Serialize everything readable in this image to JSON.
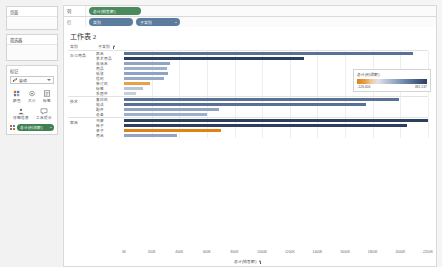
{
  "sidebar": {
    "pages": {
      "title": "页面"
    },
    "filters": {
      "title": "筛选器"
    },
    "marks": {
      "title": "标记",
      "mark_type": "自动",
      "buttons": [
        {
          "label": "颜色",
          "icon": "color-icon"
        },
        {
          "label": "大小",
          "icon": "size-icon"
        },
        {
          "label": "标签",
          "icon": "label-icon"
        },
        {
          "label": "详细信息",
          "icon": "detail-icon"
        },
        {
          "label": "工具提示",
          "icon": "tooltip-icon"
        }
      ],
      "color_pill": "总计(利润额)"
    }
  },
  "shelves": {
    "columns": {
      "name": "列",
      "pills": [
        {
          "label": "总计(销售额)",
          "type": "green",
          "caret": false
        }
      ]
    },
    "rows": {
      "name": "行",
      "pills": [
        {
          "label": "类别",
          "type": "blue",
          "caret": false
        },
        {
          "label": "子类别",
          "type": "blue",
          "caret": true
        }
      ]
    }
  },
  "view": {
    "sheet_title": "工作表 2",
    "headers": {
      "category": "类别",
      "subcategory": "子类别"
    },
    "axis_title": "总计(销售额)"
  },
  "legend": {
    "title": "总计(利润额)",
    "min": "-128,406",
    "max": "381,137"
  },
  "chart_data": {
    "type": "bar",
    "orientation": "horizontal",
    "title": "工作表 2",
    "xlabel": "总计(销售额)",
    "ylabel": "类别 / 子类别",
    "xlim": [
      0,
      2200000
    ],
    "xticks": [
      "0K",
      "200K",
      "400K",
      "600K",
      "800K",
      "1000K",
      "1200K",
      "1400K",
      "1600K",
      "1800K",
      "2000K",
      "2200K"
    ],
    "grid": true,
    "color_field": "总计(利润额)",
    "color_scale": {
      "min": -128406,
      "max": 381137,
      "low_color": "#e08214",
      "mid_color": "#c8cedb",
      "high_color": "#2d3f5e"
    },
    "groups": [
      {
        "name": "办公用品",
        "rows": [
          {
            "label": "器具",
            "value": 2090000,
            "color": "#5a7196"
          },
          {
            "label": "美术用品",
            "value": 1300000,
            "color": "#2d3f5e"
          },
          {
            "label": "收纳具",
            "value": 330000,
            "color": "#93a4c2"
          },
          {
            "label": "用品",
            "value": 310000,
            "color": "#9db0cb"
          },
          {
            "label": "纸张",
            "value": 320000,
            "color": "#8ea3c3"
          },
          {
            "label": "信封",
            "value": 290000,
            "color": "#97a9c6"
          },
          {
            "label": "装订机",
            "value": 190000,
            "color": "#e8a04a"
          },
          {
            "label": "标签",
            "value": 140000,
            "color": "#b9c4d6"
          },
          {
            "label": "系固件",
            "value": 90000,
            "color": "#c5cedd"
          }
        ]
      },
      {
        "name": "技术",
        "rows": [
          {
            "label": "复印机",
            "value": 1990000,
            "color": "#5a7196"
          },
          {
            "label": "电话",
            "value": 1750000,
            "color": "#5e7characters"
          },
          {
            "label": "配件",
            "value": 690000,
            "color": "#93a4c2"
          },
          {
            "label": "设备",
            "value": 600000,
            "color": "#9db0cb"
          }
        ]
      },
      {
        "name": "家具",
        "rows": [
          {
            "label": "书架",
            "value": 2200000,
            "color": "#2d3f5e"
          },
          {
            "label": "椅子",
            "value": 2050000,
            "color": "#2d3f5e"
          },
          {
            "label": "桌子",
            "value": 700000,
            "color": "#e08214"
          },
          {
            "label": "用具",
            "value": 380000,
            "color": "#93a4c2"
          }
        ]
      }
    ]
  }
}
